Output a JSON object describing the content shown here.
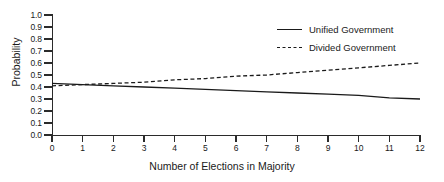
{
  "chart_data": {
    "type": "line",
    "title": "",
    "xlabel": "Number of Elections in Majority",
    "ylabel": "Probability",
    "xlim": [
      0,
      12
    ],
    "ylim": [
      0,
      1.0
    ],
    "grid": false,
    "legend_position": "top-right",
    "x": [
      0,
      1,
      2,
      3,
      4,
      5,
      6,
      7,
      8,
      9,
      10,
      11,
      12
    ],
    "xtick_labels": [
      "0",
      "1",
      "2",
      "3",
      "4",
      "5",
      "6",
      "7",
      "8",
      "9",
      "10",
      "11",
      "12"
    ],
    "ytick_labels": [
      "0.0",
      "0.1",
      "0.2",
      "0.3",
      "0.4",
      "0.5",
      "0.6",
      "0.7",
      "0.8",
      "0.9",
      "1.0"
    ],
    "ytick_values": [
      0.0,
      0.1,
      0.2,
      0.3,
      0.4,
      0.5,
      0.6,
      0.7,
      0.8,
      0.9,
      1.0
    ],
    "series": [
      {
        "name": "Unified Government",
        "style": "solid",
        "color": "#1a1a1a",
        "values": [
          0.43,
          0.42,
          0.41,
          0.4,
          0.39,
          0.38,
          0.37,
          0.36,
          0.35,
          0.34,
          0.33,
          0.31,
          0.3
        ]
      },
      {
        "name": "Divided Government",
        "style": "dashed",
        "color": "#1a1a1a",
        "values": [
          0.41,
          0.42,
          0.43,
          0.44,
          0.46,
          0.47,
          0.49,
          0.5,
          0.52,
          0.54,
          0.56,
          0.58,
          0.6
        ]
      }
    ]
  },
  "legend": {
    "items": [
      {
        "label": "Unified Government"
      },
      {
        "label": "Divided Government"
      }
    ]
  }
}
